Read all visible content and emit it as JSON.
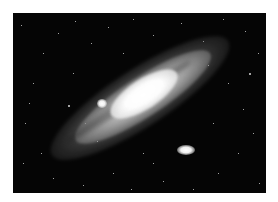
{
  "image": {
    "subject": "spiral galaxy with two satellite galaxies",
    "background_color": "#050505",
    "border_color": "#ffffff"
  },
  "galaxy": {
    "core_color": "#ffffff",
    "disk_color": "#c8c8c8",
    "tilt_degrees": -33
  },
  "satellites": [
    {
      "name": "upper-left-satellite",
      "x": 84,
      "y": 86,
      "w": 10,
      "h": 9
    },
    {
      "name": "lower-right-satellite",
      "x": 164,
      "y": 132,
      "w": 18,
      "h": 10
    }
  ],
  "stars": [
    [
      8,
      12,
      1
    ],
    [
      30,
      40,
      1
    ],
    [
      45,
      20,
      1
    ],
    [
      62,
      8,
      1
    ],
    [
      78,
      30,
      1
    ],
    [
      95,
      14,
      1
    ],
    [
      120,
      6,
      1
    ],
    [
      140,
      22,
      1
    ],
    [
      168,
      10,
      1
    ],
    [
      190,
      28,
      1
    ],
    [
      210,
      6,
      1
    ],
    [
      232,
      18,
      1
    ],
    [
      245,
      40,
      1
    ],
    [
      20,
      70,
      1
    ],
    [
      12,
      110,
      1
    ],
    [
      28,
      140,
      1
    ],
    [
      40,
      165,
      1
    ],
    [
      70,
      172,
      1
    ],
    [
      100,
      160,
      1
    ],
    [
      118,
      176,
      1
    ],
    [
      140,
      150,
      1
    ],
    [
      150,
      168,
      1
    ],
    [
      205,
      160,
      1
    ],
    [
      225,
      140,
      1
    ],
    [
      240,
      120,
      1
    ],
    [
      230,
      96,
      1
    ],
    [
      215,
      70,
      1
    ],
    [
      60,
      60,
      1
    ],
    [
      72,
      110,
      1
    ],
    [
      84,
      128,
      1
    ],
    [
      200,
      110,
      1
    ],
    [
      246,
      170,
      1
    ],
    [
      180,
      176,
      1
    ],
    [
      16,
      90,
      1
    ],
    [
      55,
      92,
      2
    ],
    [
      236,
      60,
      2
    ],
    [
      110,
      40,
      1
    ],
    [
      130,
      140,
      1
    ],
    [
      195,
      52,
      1
    ],
    [
      10,
      150,
      1
    ]
  ]
}
